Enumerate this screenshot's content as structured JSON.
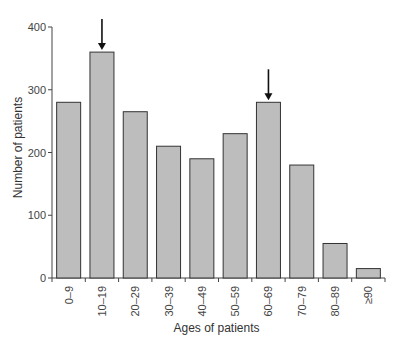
{
  "chart_data": {
    "type": "bar",
    "title": "",
    "xlabel": "Ages of patients",
    "ylabel": "Number of patients",
    "categories": [
      "0–9",
      "10–19",
      "20–29",
      "30–39",
      "40–49",
      "50–59",
      "60–69",
      "70–79",
      "80–89",
      "≥90"
    ],
    "values": [
      280,
      360,
      265,
      210,
      190,
      230,
      280,
      180,
      55,
      15
    ],
    "ylim": [
      0,
      400
    ],
    "yticks": [
      0,
      100,
      200,
      300,
      400
    ],
    "grid": false,
    "annotations": [
      {
        "type": "arrow",
        "category": "10–19",
        "direction": "down"
      },
      {
        "type": "arrow",
        "category": "60–69",
        "direction": "down"
      }
    ],
    "bar_color": "#bdbdbd",
    "bar_edge_color": "#333333"
  }
}
